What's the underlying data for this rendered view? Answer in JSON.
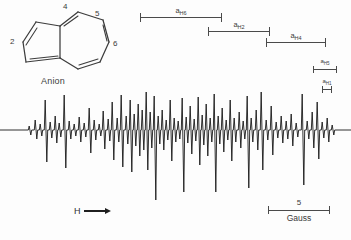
{
  "figure": {
    "kind": "esr-spectrum",
    "species_label": "Anion",
    "field_axis_label": "H",
    "line_color": "#1a1a1a",
    "rule_color": "#4a4a4a"
  },
  "molecule": {
    "name": "azulene-anion-skeleton",
    "ring_numbers": [
      {
        "id": "pos2",
        "label": "2",
        "x": 2,
        "y": 38
      },
      {
        "id": "pos4",
        "label": "4",
        "x": 55,
        "y": 5
      },
      {
        "id": "pos5",
        "label": "5",
        "x": 86,
        "y": 11
      },
      {
        "id": "pos6",
        "label": "6",
        "x": 108,
        "y": 40
      }
    ]
  },
  "coupling_bars": [
    {
      "id": "aH6",
      "label": "a",
      "sub": "H6",
      "left": 140,
      "top": 8,
      "width": 82,
      "size": "normal"
    },
    {
      "id": "aH2",
      "label": "a",
      "sub": "H2",
      "left": 208,
      "top": 22,
      "width": 62,
      "size": "normal"
    },
    {
      "id": "aH4",
      "label": "a",
      "sub": "H4",
      "left": 266,
      "top": 33,
      "width": 60,
      "size": "normal"
    },
    {
      "id": "aH5",
      "label": "a",
      "sub": "H5",
      "left": 313,
      "top": 60,
      "width": 24,
      "size": "small"
    },
    {
      "id": "aH1",
      "label": "a",
      "sub": "H1",
      "left": 322,
      "top": 80,
      "width": 10,
      "size": "small"
    }
  ],
  "gauss_scale": {
    "value": "5",
    "unit": "Gauss"
  },
  "chart_data": {
    "type": "line",
    "title": "",
    "xlabel": "H",
    "ylabel": "",
    "x_unit": "Gauss",
    "scale_bar_gauss": 5,
    "baseline_y": 42,
    "xlim": [
      0,
      351
    ],
    "ylim": [
      -70,
      42
    ],
    "grid": false,
    "legend": null,
    "annotations": [
      "a_H6",
      "a_H2",
      "a_H4",
      "a_H5",
      "a_H1",
      "Anion",
      "H"
    ],
    "peaks": [
      {
        "x": 30,
        "up": 4,
        "down": 5
      },
      {
        "x": 36,
        "up": 10,
        "down": 9
      },
      {
        "x": 41,
        "up": 6,
        "down": 6
      },
      {
        "x": 46,
        "up": 30,
        "down": 32
      },
      {
        "x": 51,
        "up": 8,
        "down": 8
      },
      {
        "x": 56,
        "up": 14,
        "down": 13
      },
      {
        "x": 60,
        "up": 7,
        "down": 7
      },
      {
        "x": 65,
        "up": 35,
        "down": 38
      },
      {
        "x": 70,
        "up": 9,
        "down": 9
      },
      {
        "x": 75,
        "up": 6,
        "down": 6
      },
      {
        "x": 80,
        "up": 13,
        "down": 12
      },
      {
        "x": 85,
        "up": 7,
        "down": 7
      },
      {
        "x": 90,
        "up": 22,
        "down": 23
      },
      {
        "x": 95,
        "up": 10,
        "down": 10
      },
      {
        "x": 100,
        "up": 6,
        "down": 6
      },
      {
        "x": 104,
        "up": 19,
        "down": 19
      },
      {
        "x": 109,
        "up": 11,
        "down": 11
      },
      {
        "x": 113,
        "up": 28,
        "down": 30
      },
      {
        "x": 118,
        "up": 12,
        "down": 12
      },
      {
        "x": 122,
        "up": 35,
        "down": 37
      },
      {
        "x": 127,
        "up": 14,
        "down": 14
      },
      {
        "x": 131,
        "up": 30,
        "down": 42
      },
      {
        "x": 135,
        "up": 16,
        "down": 16
      },
      {
        "x": 139,
        "up": 26,
        "down": 26
      },
      {
        "x": 143,
        "up": 20,
        "down": 20
      },
      {
        "x": 147,
        "up": 38,
        "down": 40
      },
      {
        "x": 151,
        "up": 18,
        "down": 18
      },
      {
        "x": 155,
        "up": 34,
        "down": 70
      },
      {
        "x": 159,
        "up": 14,
        "down": 14
      },
      {
        "x": 163,
        "up": 20,
        "down": 20
      },
      {
        "x": 167,
        "up": 10,
        "down": 10
      },
      {
        "x": 171,
        "up": 30,
        "down": 31
      },
      {
        "x": 175,
        "up": 12,
        "down": 12
      },
      {
        "x": 179,
        "up": 9,
        "down": 9
      },
      {
        "x": 183,
        "up": 32,
        "down": 62
      },
      {
        "x": 187,
        "up": 13,
        "down": 13
      },
      {
        "x": 191,
        "up": 24,
        "down": 24
      },
      {
        "x": 195,
        "up": 11,
        "down": 11
      },
      {
        "x": 199,
        "up": 33,
        "down": 35
      },
      {
        "x": 203,
        "up": 15,
        "down": 15
      },
      {
        "x": 207,
        "up": 26,
        "down": 26
      },
      {
        "x": 211,
        "up": 12,
        "down": 12
      },
      {
        "x": 215,
        "up": 36,
        "down": 62
      },
      {
        "x": 219,
        "up": 14,
        "down": 14
      },
      {
        "x": 223,
        "up": 22,
        "down": 22
      },
      {
        "x": 227,
        "up": 10,
        "down": 10
      },
      {
        "x": 231,
        "up": 30,
        "down": 31
      },
      {
        "x": 235,
        "up": 12,
        "down": 12
      },
      {
        "x": 240,
        "up": 18,
        "down": 18
      },
      {
        "x": 244,
        "up": 9,
        "down": 9
      },
      {
        "x": 248,
        "up": 34,
        "down": 58
      },
      {
        "x": 252,
        "up": 12,
        "down": 12
      },
      {
        "x": 257,
        "up": 20,
        "down": 20
      },
      {
        "x": 262,
        "up": 38,
        "down": 40
      },
      {
        "x": 267,
        "up": 10,
        "down": 10
      },
      {
        "x": 272,
        "up": 24,
        "down": 25
      },
      {
        "x": 277,
        "up": 8,
        "down": 8
      },
      {
        "x": 282,
        "up": 14,
        "down": 13
      },
      {
        "x": 287,
        "up": 9,
        "down": 9
      },
      {
        "x": 292,
        "up": 16,
        "down": 16
      },
      {
        "x": 297,
        "up": 7,
        "down": 7
      },
      {
        "x": 303,
        "up": 36,
        "down": 55
      },
      {
        "x": 308,
        "up": 9,
        "down": 9
      },
      {
        "x": 313,
        "up": 18,
        "down": 18
      },
      {
        "x": 318,
        "up": 28,
        "down": 29
      },
      {
        "x": 323,
        "up": 8,
        "down": 8
      },
      {
        "x": 328,
        "up": 12,
        "down": 12
      },
      {
        "x": 333,
        "up": 5,
        "down": 5
      }
    ]
  }
}
